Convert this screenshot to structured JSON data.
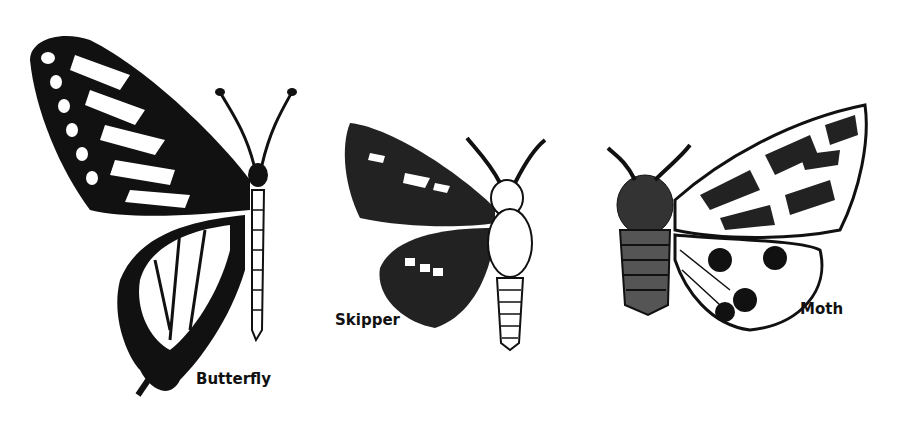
{
  "figures": [
    {
      "id": "butterfly",
      "label": "Butterfly"
    },
    {
      "id": "skipper",
      "label": "Skipper"
    },
    {
      "id": "moth",
      "label": "Moth"
    }
  ],
  "colors": {
    "ink": "#111111",
    "paper": "#ffffff"
  }
}
